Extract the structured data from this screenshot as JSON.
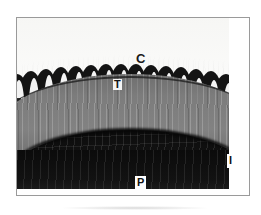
{
  "figure": {
    "kind": "histology-micrograph",
    "frame": {
      "border_color": "#9a9a9a",
      "background_color": "#ffffff"
    }
  },
  "labels": [
    {
      "id": "C",
      "text": "C",
      "region_name": "outer-striated-layer",
      "style": "plain-dark-letter",
      "color": "#1a1a1a",
      "position": {
        "x": 119,
        "y": 34
      }
    },
    {
      "id": "T",
      "text": "T",
      "region_name": "scalloped-cell-row",
      "style": "dark-letter-on-pale-patch",
      "color": "#121212",
      "position": {
        "x": 96,
        "y": 61
      }
    },
    {
      "id": "I",
      "text": "I",
      "region_name": "striated-mid-grey-arc",
      "style": "dark-letter-in-white-box",
      "color": "#121212",
      "position": {
        "x": 210,
        "y": 136
      }
    },
    {
      "id": "P",
      "text": "P",
      "region_name": "dark-inner-core",
      "style": "dark-letter-in-white-box",
      "color": "#121212",
      "position": {
        "x": 118,
        "y": 158
      }
    }
  ],
  "regions": [
    {
      "label": "C",
      "tone": "pale grey with fine horizontal streaks",
      "dominant_color": "#f4f4f2"
    },
    {
      "label": "T",
      "tone": "alternating near-black cells with white interstices, scalloped upper margin",
      "dominant_color": "#191919"
    },
    {
      "label": "I",
      "tone": "medium grey with dense vertical striations",
      "dominant_color": "#7a7a7a"
    },
    {
      "label": "P",
      "tone": "very dark, near-black with horizontal streaking",
      "dominant_color": "#101010"
    }
  ]
}
